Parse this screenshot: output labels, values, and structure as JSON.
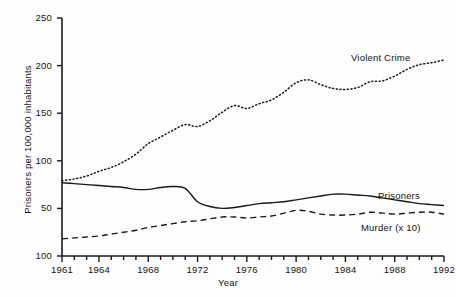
{
  "chart_data": {
    "type": "line",
    "title": "",
    "xlabel": "Year",
    "ylabel": "Prisoners per 100,000 inhabitants",
    "xlim": [
      1961,
      1992
    ],
    "ylim": [
      0,
      250
    ],
    "grid": false,
    "legend_position": "inline-annotations",
    "x_tick_labels": [
      "1961",
      "1964",
      "1968",
      "1972",
      "1976",
      "1980",
      "1984",
      "1988",
      "1992"
    ],
    "x_tick_values": [
      1961,
      1964,
      1968,
      1972,
      1976,
      1980,
      1984,
      1988,
      1992
    ],
    "y_tick_labels": [
      "100",
      "50",
      "100",
      "150",
      "200",
      "250"
    ],
    "y_tick_values": [
      0,
      50,
      100,
      150,
      200,
      250
    ],
    "y_axis_note": "Bottom-most tick is printed as '100' in the source scan; it marks the 0 baseline.",
    "x": [
      1961,
      1962,
      1963,
      1964,
      1965,
      1966,
      1967,
      1968,
      1969,
      1970,
      1971,
      1972,
      1973,
      1974,
      1975,
      1976,
      1977,
      1978,
      1979,
      1980,
      1981,
      1982,
      1983,
      1984,
      1985,
      1986,
      1987,
      1988,
      1989,
      1990,
      1991,
      1992
    ],
    "series": [
      {
        "name": "Violent Crime",
        "style": "dotted",
        "color": "#1a1a1a",
        "values": [
          79,
          81,
          84,
          89,
          93,
          99,
          107,
          118,
          125,
          132,
          138,
          136,
          142,
          151,
          158,
          155,
          160,
          164,
          172,
          182,
          185,
          180,
          176,
          175,
          177,
          183,
          184,
          189,
          196,
          201,
          203,
          206
        ]
      },
      {
        "name": "Prisoners",
        "style": "solid",
        "color": "#1a1a1a",
        "values": [
          77,
          76,
          75,
          74,
          73,
          72,
          70,
          70,
          72,
          73,
          71,
          57,
          52,
          50,
          51,
          53,
          55,
          56,
          57,
          59,
          61,
          63,
          65,
          65,
          64,
          63,
          61,
          59,
          57,
          55,
          54,
          53
        ]
      },
      {
        "name": "Murder (x 10)",
        "style": "dashed",
        "color": "#1a1a1a",
        "values": [
          18,
          19,
          20,
          21,
          23,
          25,
          27,
          30,
          32,
          34,
          36,
          37,
          39,
          41,
          41,
          40,
          41,
          42,
          45,
          48,
          47,
          44,
          43,
          43,
          44,
          46,
          45,
          44,
          45,
          46,
          46,
          44
        ]
      }
    ]
  },
  "annotations": {
    "violent_crime_label": "Violent Crime",
    "prisoners_label": "Prisoners",
    "murder_label": "Murder (x 10)"
  }
}
